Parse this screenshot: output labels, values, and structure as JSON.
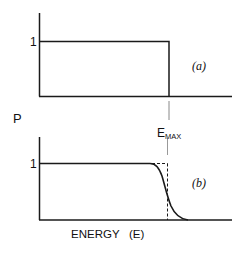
{
  "figure": {
    "y_axis_label": "P",
    "x_axis_label": "ENERGY   (E)",
    "emax_label_main": "E",
    "emax_label_sub": "MAX",
    "panels": [
      {
        "id": "a",
        "label": "(a)",
        "y_tick": "1",
        "shape": "step function: P=1 for E<E_MAX, 0 beyond"
      },
      {
        "id": "b",
        "label": "(b)",
        "y_tick": "1",
        "shape": "smooth sigmoid rolloff around E_MAX with dashed ideal step"
      }
    ]
  },
  "colors": {
    "line": "#1a1a1a",
    "tick": "#888888"
  }
}
